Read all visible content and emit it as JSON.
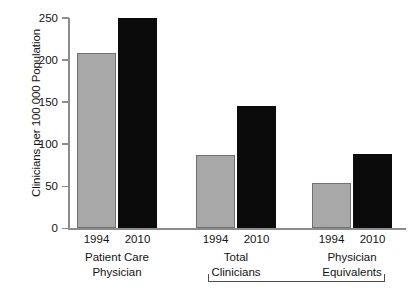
{
  "chart_data": {
    "type": "bar",
    "title": "",
    "subtitle": "",
    "xlabel": "",
    "ylabel": "Clinicians per 100 000 Population",
    "ylim": [
      0,
      250
    ],
    "yticks": [
      0,
      50,
      100,
      150,
      200,
      250
    ],
    "ytick_labels": [
      "0",
      "50",
      "100",
      "150",
      "200",
      "250"
    ],
    "grid": false,
    "legend": "none",
    "categories": [
      "Patient Care Physician",
      "Total Clinicians",
      "Physician Equivalents"
    ],
    "series": [
      {
        "name": "1994",
        "color": "#a8a8a8",
        "values": [
          209,
          87,
          54
        ]
      },
      {
        "name": "2010",
        "color": "#0b0b0b",
        "values": [
          250,
          145,
          88
        ]
      }
    ],
    "groups": [
      {
        "id": "patient-care-physician",
        "label_line1": "Patient Care",
        "label_line2": "Physician",
        "bars": [
          {
            "year": "1994",
            "value": 209,
            "style": "gray"
          },
          {
            "year": "2010",
            "value": 250,
            "style": "black"
          }
        ]
      },
      {
        "id": "total-clinicians",
        "label_line1": "Total",
        "label_line2": "Clinicians",
        "bars": [
          {
            "year": "1994",
            "value": 87,
            "style": "gray"
          },
          {
            "year": "2010",
            "value": 145,
            "style": "black"
          }
        ]
      },
      {
        "id": "physician-equivalents",
        "label_line1": "Physician",
        "label_line2": "Equivalents",
        "bars": [
          {
            "year": "1994",
            "value": 54,
            "style": "gray"
          },
          {
            "year": "2010",
            "value": 88,
            "style": "black"
          }
        ]
      }
    ],
    "bracket": {
      "spans": [
        "Total Clinicians",
        "Physician Equivalents"
      ],
      "label": ""
    },
    "colors": {
      "series_1994": "#a8a8a8",
      "series_2010": "#0b0b0b",
      "axis": "#8c8c8c",
      "text": "#141414",
      "background": "#ffffff"
    }
  }
}
